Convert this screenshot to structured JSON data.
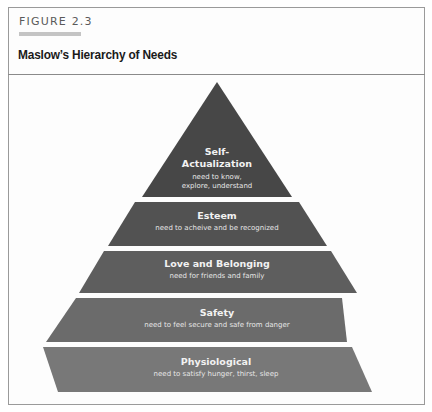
{
  "figure": {
    "label": "FIGURE 2.3",
    "title": "Maslow’s Hierarchy of Needs"
  },
  "pyramid": {
    "tiers": [
      {
        "title_line1": "Self-",
        "title_line2": "Actualization",
        "desc_line1": "need to know,",
        "desc_line2": "explore, understand",
        "color": "#474747"
      },
      {
        "title": "Esteem",
        "desc": "need to acheive and be recognized",
        "color": "#525252"
      },
      {
        "title": "Love and Belonging",
        "desc": "need for friends and family",
        "color": "#5e5e5e"
      },
      {
        "title": "Safety",
        "desc": "need to feel secure and safe from danger",
        "color": "#6b6b6b"
      },
      {
        "title": "Physiological",
        "desc": "need to satisfy hunger, thirst, sleep",
        "color": "#787878"
      }
    ]
  }
}
